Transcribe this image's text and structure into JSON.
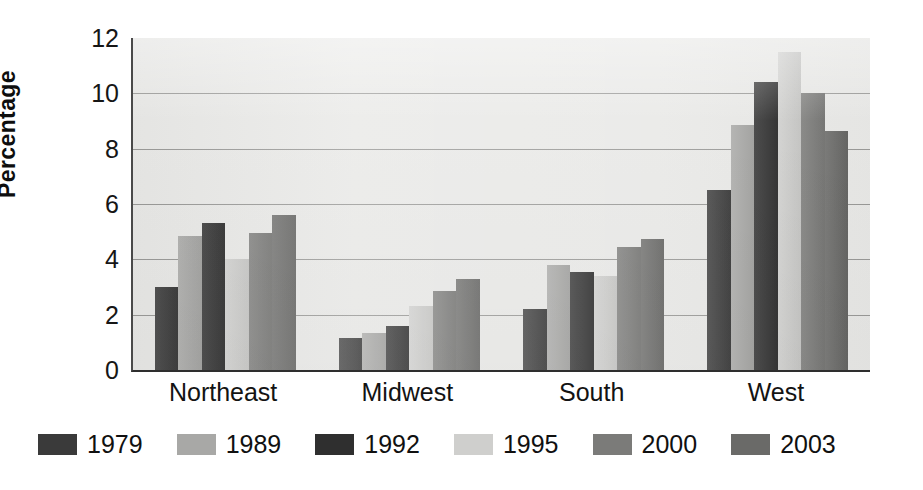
{
  "chart_data": {
    "type": "bar",
    "title": "",
    "xlabel": "",
    "ylabel": "Percentage",
    "ylim": [
      0,
      12
    ],
    "ytick_values": [
      0,
      2,
      4,
      6,
      8,
      10,
      12
    ],
    "ytick_labels": [
      "0",
      "2",
      "4",
      "6",
      "8",
      "10",
      "12"
    ],
    "grid": true,
    "grid_axis": "y",
    "legend_position": "below-axes-left",
    "categories": [
      "Northeast",
      "Midwest",
      "South",
      "West"
    ],
    "series": [
      {
        "name": "1979",
        "color": "#3a3a3a",
        "values": [
          3.0,
          1.15,
          2.2,
          6.5
        ]
      },
      {
        "name": "1989",
        "color": "#a8a8a6",
        "values": [
          4.85,
          1.35,
          3.8,
          8.85
        ]
      },
      {
        "name": "1992",
        "color": "#2f2f2f",
        "values": [
          5.3,
          1.6,
          3.55,
          10.4
        ]
      },
      {
        "name": "1995",
        "color": "#cfcfcd",
        "values": [
          4.0,
          2.3,
          3.4,
          11.5
        ]
      },
      {
        "name": "2000",
        "color": "#7b7b79",
        "values": [
          4.95,
          2.85,
          4.45,
          10.0
        ]
      },
      {
        "name": "2003",
        "color": "#6a6a68",
        "values": [
          5.6,
          3.3,
          4.75,
          8.65
        ]
      }
    ],
    "panel_color": "#e9e9e7",
    "gridline_color": "#9a9a98",
    "axis_color": "#2e2e2e"
  }
}
